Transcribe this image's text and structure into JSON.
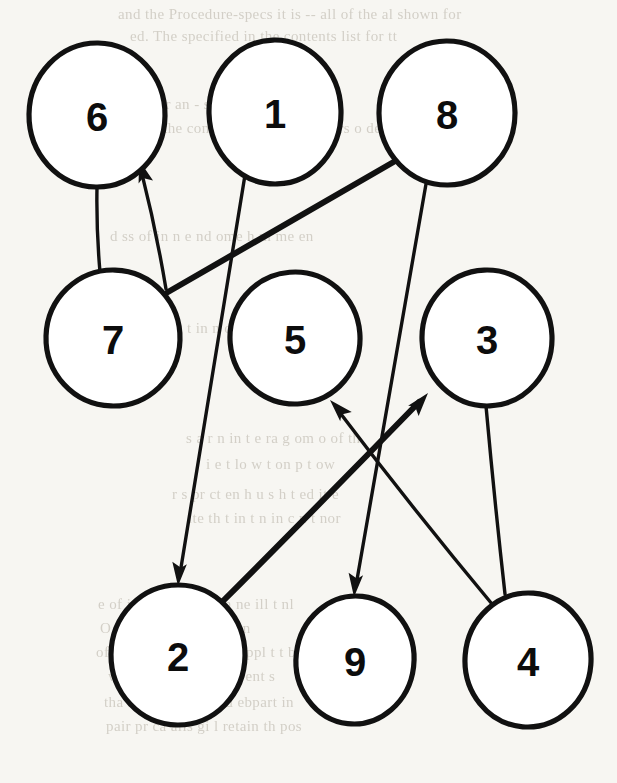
{
  "page": {
    "width": 617,
    "height": 783,
    "background_color": "#f7f6f2",
    "ink_color": "#111111",
    "node_fill_color": "#ffffff"
  },
  "graph": {
    "type": "directed-graph",
    "node_count": 9,
    "edge_count": 8,
    "nodes": [
      {
        "id": "6",
        "label": "6",
        "cx": 97,
        "cy": 115,
        "rx": 68,
        "ry": 72
      },
      {
        "id": "1",
        "label": "1",
        "cx": 275,
        "cy": 112,
        "rx": 66,
        "ry": 72
      },
      {
        "id": "8",
        "label": "8",
        "cx": 447,
        "cy": 113,
        "rx": 68,
        "ry": 72
      },
      {
        "id": "7",
        "label": "7",
        "cx": 113,
        "cy": 338,
        "rx": 67,
        "ry": 68
      },
      {
        "id": "5",
        "label": "5",
        "cx": 295,
        "cy": 338,
        "rx": 65,
        "ry": 66
      },
      {
        "id": "3",
        "label": "3",
        "cx": 487,
        "cy": 338,
        "rx": 65,
        "ry": 68
      },
      {
        "id": "2",
        "label": "2",
        "cx": 178,
        "cy": 655,
        "rx": 67,
        "ry": 70
      },
      {
        "id": "9",
        "label": "9",
        "cx": 355,
        "cy": 660,
        "rx": 59,
        "ry": 64
      },
      {
        "id": "4",
        "label": "4",
        "cx": 528,
        "cy": 660,
        "rx": 63,
        "ry": 67
      }
    ],
    "edges": [
      {
        "id": "e-7-6",
        "from": "7",
        "to": "6",
        "directed": true,
        "weight": "thin",
        "x1": 166,
        "y1": 289,
        "x2": 139,
        "y2": 160
      },
      {
        "id": "e-6-7",
        "from": "6",
        "to": "7",
        "directed": false,
        "weight": "thin",
        "x1": 97,
        "y1": 187,
        "x2": 100,
        "y2": 272
      },
      {
        "id": "e-8-7",
        "from": "8",
        "to": "7",
        "directed": false,
        "weight": "thick",
        "x1": 397,
        "y1": 160,
        "x2": 168,
        "y2": 292
      },
      {
        "id": "e-1-2",
        "from": "1",
        "to": "2",
        "directed": true,
        "weight": "thin",
        "x1": 245,
        "y1": 175,
        "x2": 178,
        "y2": 586
      },
      {
        "id": "e-2-3",
        "from": "2",
        "to": "3",
        "directed": true,
        "weight": "thick",
        "x1": 220,
        "y1": 604,
        "x2": 428,
        "y2": 393
      },
      {
        "id": "e-8-9",
        "from": "8",
        "to": "9",
        "directed": true,
        "weight": "thin",
        "x1": 426,
        "y1": 184,
        "x2": 354,
        "y2": 597
      },
      {
        "id": "e-4-5",
        "from": "4",
        "to": "5",
        "directed": true,
        "weight": "thin",
        "x1": 492,
        "y1": 604,
        "x2": 330,
        "y2": 400
      },
      {
        "id": "e-3-4",
        "from": "3",
        "to": "4",
        "directed": false,
        "weight": "thin",
        "x1": 486,
        "y1": 406,
        "x2": 505,
        "y2": 594
      }
    ],
    "adjacency_text": "7->6, 6-7, 8-7, 1->2, 2->3, 8->9, 4->5, 3-4"
  },
  "bleedthrough": {
    "lines": [
      {
        "text": "and the Procedure-specs it is -- all of the  al shown for",
        "x": 118,
        "y": 6
      },
      {
        "text": "ed. The specified in the contents list for tt",
        "x": 130,
        "y": 28
      },
      {
        "text": "l under an  - sense  h    n  of  e   o ta",
        "x": 126,
        "y": 96
      },
      {
        "text": "npt in the context of  th  ns to the  ors  o  de",
        "x": 122,
        "y": 120
      },
      {
        "text": "d  ss of   in  n  e   nd   ome  h  m    me   en",
        "x": 110,
        "y": 228
      },
      {
        "text": "at  an   h   t   in    n  of  the   ity",
        "x": 140,
        "y": 320
      },
      {
        "text": "s  a   r  n   in   t e   ra  g    om   o  of  th",
        "x": 186,
        "y": 430
      },
      {
        "text": "i e    t    lo     w   t on     p    t   ow",
        "x": 206,
        "y": 456
      },
      {
        "text": "r  s  pr  ct  en    h  u   s  h  t  ed    it   e",
        "x": 172,
        "y": 486
      },
      {
        "text": "ite   th   t  in   t  n  in    c    n   t  nor",
        "x": 188,
        "y": 510
      },
      {
        "text": "e  of   i   d  st     bo e    wh  ch     ne  ill  t  nl",
        "x": 98,
        "y": 596
      },
      {
        "text": "O    t   ur     P  ocess  s  al   ntain",
        "x": 100,
        "y": 620
      },
      {
        "text": "of  wh    ch  ge  is with   the  ppl t   t    bject",
        "x": 96,
        "y": 644
      },
      {
        "text": "w     f  r  later  If   the   st   re   ent  s",
        "x": 108,
        "y": 668
      },
      {
        "text": "tha  it  is  to  rm    Hou  d  ebpart   in",
        "x": 104,
        "y": 694
      },
      {
        "text": "pair  pr        ca     alis  gi   l  retain  th  pos",
        "x": 106,
        "y": 718
      }
    ]
  }
}
